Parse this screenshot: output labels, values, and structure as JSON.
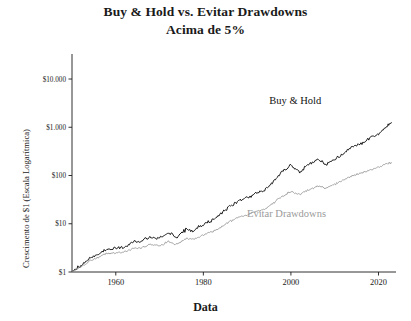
{
  "chart": {
    "title_line1": "Buy & Hold vs. Evitar Drawdowns",
    "title_line2": "Acima de 5%",
    "xlabel": "Data",
    "ylabel": "Crescimento de $1  (Escala Logarítmica)"
  },
  "chart_data": {
    "type": "line",
    "title": "Buy & Hold vs. Evitar Drawdowns Acima de 5%",
    "xlabel": "Data",
    "ylabel": "Crescimento de $1  (Escala Logarítmica)",
    "log_y": true,
    "ylim": [
      1,
      30000
    ],
    "xlim": [
      1950,
      2024
    ],
    "ytick_labels": [
      "$1",
      "$10",
      "$100",
      "$1.000",
      "$10.000"
    ],
    "ytick_values": [
      1,
      10,
      100,
      1000,
      10000
    ],
    "xtick_labels": [
      "1960",
      "1980",
      "2000",
      "2020"
    ],
    "xtick_values": [
      1960,
      1980,
      2000,
      2020
    ],
    "grid": false,
    "legend_position": "inline-annotations",
    "series": [
      {
        "name": "Buy & Hold",
        "color": "#1a1a1a",
        "label_x": 2001,
        "label_y": 3000,
        "x": [
          1950,
          1952,
          1954,
          1956,
          1958,
          1960,
          1962,
          1964,
          1966,
          1968,
          1970,
          1972,
          1974,
          1976,
          1978,
          1980,
          1982,
          1984,
          1986,
          1988,
          1990,
          1992,
          1994,
          1996,
          1998,
          2000,
          2002,
          2004,
          2006,
          2008,
          2010,
          2012,
          2014,
          2016,
          2018,
          2020,
          2022,
          2023
        ],
        "y": [
          1.0,
          1.35,
          1.9,
          2.3,
          2.9,
          3.1,
          3.3,
          4.2,
          4.4,
          5.3,
          5.0,
          6.6,
          5.2,
          7.6,
          7.4,
          9.8,
          11.5,
          16.0,
          23.0,
          29.0,
          34.0,
          44.0,
          50.0,
          75.0,
          120.0,
          165.0,
          120.0,
          165.0,
          215.0,
          170.0,
          215.0,
          280.0,
          400.0,
          460.0,
          600.0,
          720.0,
          1050.0,
          1250.0
        ]
      },
      {
        "name": "Evitar Drawdowns",
        "color": "#9a9a9a",
        "label_x": 1999,
        "label_y": 14,
        "x": [
          1950,
          1952,
          1954,
          1956,
          1958,
          1960,
          1962,
          1964,
          1966,
          1968,
          1970,
          1972,
          1974,
          1976,
          1978,
          1980,
          1982,
          1984,
          1986,
          1988,
          1990,
          1992,
          1994,
          1996,
          1998,
          2000,
          2002,
          2004,
          2006,
          2008,
          2010,
          2012,
          2014,
          2016,
          2018,
          2020,
          2022,
          2023
        ],
        "y": [
          1.0,
          1.25,
          1.7,
          2.0,
          2.4,
          2.5,
          2.6,
          3.1,
          3.2,
          3.7,
          3.5,
          4.3,
          3.7,
          4.9,
          4.8,
          6.0,
          6.8,
          8.5,
          11.0,
          13.5,
          15.0,
          18.0,
          20.0,
          27.0,
          37.0,
          47.0,
          40.0,
          50.0,
          60.0,
          55.0,
          66.0,
          80.0,
          100.0,
          112.0,
          130.0,
          150.0,
          175.0,
          185.0
        ]
      }
    ]
  }
}
